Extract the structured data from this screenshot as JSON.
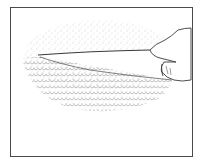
{
  "illustration": {
    "subject": "hand pulling a thin flap away from a stippled textured surface",
    "colors": {
      "ink": "#3a3a3a",
      "stipple": "#8a8a8a",
      "frame": "#4a4a4a",
      "background": "#ffffff"
    },
    "icons": [
      "hand-icon",
      "flap-icon",
      "textured-surface-icon"
    ]
  }
}
